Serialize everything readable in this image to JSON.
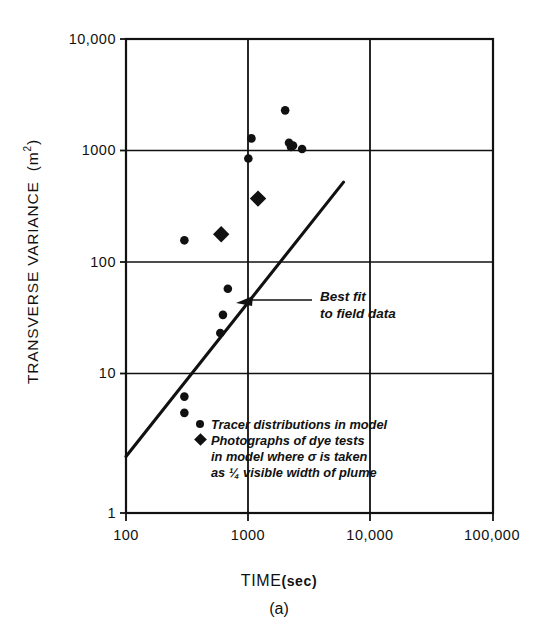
{
  "figure": {
    "panel_caption": "(a)",
    "x_axis": {
      "title": "TIME",
      "unit": "(sec)",
      "scale": "log",
      "ticks": [
        "100",
        "1000",
        "10,000",
        "100,000"
      ]
    },
    "y_axis": {
      "title": "TRANSVERSE VARIANCE",
      "unit": "m",
      "unit_exponent": "2",
      "scale": "log",
      "ticks": [
        "10,000",
        "1000",
        "100",
        "10",
        "1"
      ]
    },
    "annotation": {
      "line1": "Best fit",
      "line2": "to field data"
    },
    "legend": {
      "entries": [
        {
          "marker": "circle-marker",
          "lines": [
            "Tracer distributions in model"
          ]
        },
        {
          "marker": "diamond-marker",
          "lines": [
            "Photographs of dye tests",
            "in model where σ is taken",
            "as ¼ visible width of plume"
          ]
        }
      ]
    },
    "colors": {
      "ink": "#111111",
      "background": "#ffffff",
      "marker": "#111111"
    }
  },
  "chart_data": {
    "type": "scatter",
    "title": "",
    "subtitle": "",
    "xlabel": "TIME (sec)",
    "ylabel": "TRANSVERSE VARIANCE (m2)",
    "xscale": "log",
    "yscale": "log",
    "xlim": [
      100,
      100000
    ],
    "ylim": [
      1,
      10000
    ],
    "xticks": [
      100,
      1000,
      10000,
      100000
    ],
    "xticklabels": [
      "100",
      "1000",
      "10,000",
      "100,000"
    ],
    "yticks": [
      1,
      10,
      100,
      1000,
      10000
    ],
    "yticklabels": [
      "1",
      "10",
      "100",
      "1000",
      "10,000"
    ],
    "grid": true,
    "grid_style": "major decade lines, full box frame",
    "legend_position": "inside lower-center",
    "series": [
      {
        "name": "Tracer distributions in model",
        "marker": "circle",
        "color": "#111111",
        "points": [
          [
            300,
            7.0
          ],
          [
            300,
            9.6
          ],
          [
            590,
            33
          ],
          [
            620,
            47
          ],
          [
            680,
            78
          ],
          [
            300,
            200
          ],
          [
            1000,
            980
          ],
          [
            1060,
            1450
          ],
          [
            2000,
            2500
          ],
          [
            2150,
            1330
          ],
          [
            2230,
            1230
          ],
          [
            2320,
            1260
          ],
          [
            2750,
            1180
          ]
        ]
      },
      {
        "name": "Photographs of dye tests in model where σ is taken as ¼ visible width of plume",
        "marker": "diamond",
        "color": "#111111",
        "points": [
          [
            600,
            225
          ],
          [
            1200,
            450
          ]
        ]
      }
    ],
    "fit_line": {
      "name": "Best fit to field data",
      "label_lines": [
        "Best fit",
        "to field data"
      ],
      "x_start": 100,
      "y_start": 3.0,
      "x_end": 6000,
      "y_end": 620,
      "annotation_arrow_target_x": 1240,
      "annotation_arrow_target_y": 72
    }
  }
}
